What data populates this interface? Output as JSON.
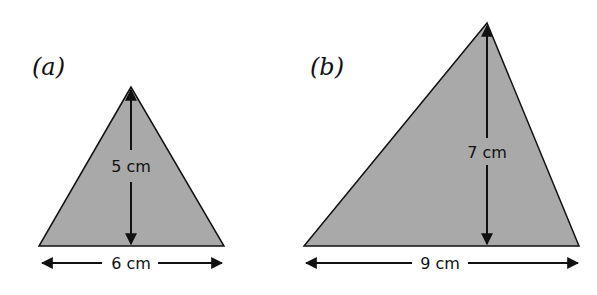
{
  "figures": [
    {
      "label": "(a)",
      "height_label": "5 cm",
      "base_label": "6 cm",
      "height_value": 5,
      "base_value": 6,
      "unit": "cm"
    },
    {
      "label": "(b)",
      "height_label": "7 cm",
      "base_label": "9 cm",
      "height_value": 7,
      "base_value": 9,
      "unit": "cm"
    }
  ],
  "colors": {
    "fill": "#a9a9a9",
    "stroke": "#111111"
  }
}
